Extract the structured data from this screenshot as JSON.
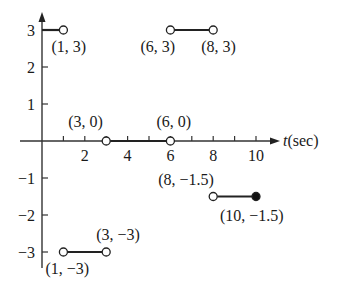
{
  "chart_data": {
    "type": "line",
    "title": "",
    "xlabel": "t(sec)",
    "ylabel": "",
    "xlim": [
      0,
      10.8
    ],
    "ylim": [
      -3.4,
      3.5
    ],
    "grid": false,
    "x_ticks": [
      1,
      2,
      3,
      4,
      5,
      6,
      7,
      8,
      9,
      10
    ],
    "x_tick_labels": [
      {
        "x": 2,
        "label": "2"
      },
      {
        "x": 4,
        "label": "4"
      },
      {
        "x": 6,
        "label": "6"
      },
      {
        "x": 8,
        "label": "8"
      },
      {
        "x": 10,
        "label": "10"
      }
    ],
    "y_ticks": [
      3,
      2,
      1,
      -1,
      -2,
      -3
    ],
    "y_tick_labels": [
      {
        "y": 3,
        "label": "3"
      },
      {
        "y": 2,
        "label": "2"
      },
      {
        "y": 1,
        "label": "1"
      },
      {
        "y": -1,
        "label": "-1"
      },
      {
        "y": -2,
        "label": "-2"
      },
      {
        "y": -3,
        "label": "-3"
      }
    ],
    "segments": [
      {
        "x0": 0,
        "y0": 3,
        "x1": 1,
        "y1": 3,
        "start": "none",
        "end": "open"
      },
      {
        "x0": 1,
        "y0": -3,
        "x1": 3,
        "y1": -3,
        "start": "open",
        "end": "open"
      },
      {
        "x0": 3,
        "y0": 0,
        "x1": 6,
        "y1": 0,
        "start": "open",
        "end": "open"
      },
      {
        "x0": 6,
        "y0": 3,
        "x1": 8,
        "y1": 3,
        "start": "open",
        "end": "open"
      },
      {
        "x0": 8,
        "y0": -1.5,
        "x1": 10,
        "y1": -1.5,
        "start": "open",
        "end": "closed"
      }
    ],
    "annotations": [
      {
        "text": "(1, 3)",
        "x": 1,
        "y": 3,
        "dx": -12,
        "dy": 22
      },
      {
        "text": "(6, 3)",
        "x": 6,
        "y": 3,
        "dx": -30,
        "dy": 22
      },
      {
        "text": "(8, 3)",
        "x": 8,
        "y": 3,
        "dx": -12,
        "dy": 22
      },
      {
        "text": "(3, 0)",
        "x": 3,
        "y": 0,
        "dx": -38,
        "dy": -14
      },
      {
        "text": "(6, 0)",
        "x": 6,
        "y": 0,
        "dx": -14,
        "dy": -14
      },
      {
        "text": "(8, −1.5)",
        "x": 8,
        "y": -1.5,
        "dx": -55,
        "dy": -12
      },
      {
        "text": "(10, −1.5)",
        "x": 10,
        "y": -1.5,
        "dx": -36,
        "dy": 24
      },
      {
        "text": "(3, −3)",
        "x": 3,
        "y": -3,
        "dx": -10,
        "dy": -12
      },
      {
        "text": "(1, −3)",
        "x": 1,
        "y": -3,
        "dx": -18,
        "dy": 22
      }
    ]
  }
}
